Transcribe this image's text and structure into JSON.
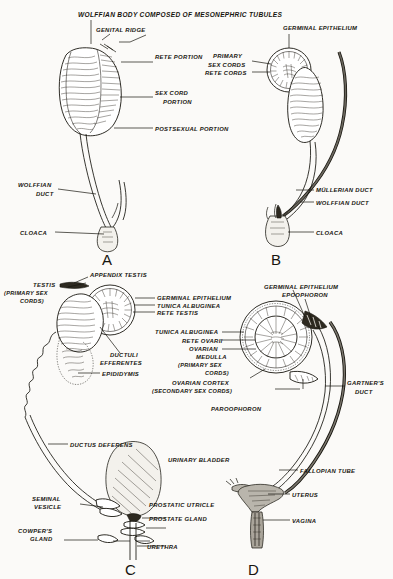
{
  "figure": {
    "title": "WOLFFIAN BODY COMPOSED OF MESONEPHRIC TUBULES",
    "background_color": "#fbfaf8",
    "ink_color": "#17150f"
  },
  "panels": [
    {
      "letter": "A",
      "name": "indifferent-gonad-stage",
      "labels": [
        {
          "id": "genital-ridge",
          "text": "GENITAL RIDGE"
        },
        {
          "id": "rete-portion",
          "text": "RETE PORTION"
        },
        {
          "id": "sex-cord-portion-1",
          "text": "SEX CORD"
        },
        {
          "id": "sex-cord-portion-2",
          "text": "PORTION"
        },
        {
          "id": "postsexual-portion",
          "text": "POSTSEXUAL PORTION"
        },
        {
          "id": "wolffian-duct-1",
          "text": "WOLFFIAN"
        },
        {
          "id": "wolffian-duct-2",
          "text": "DUCT"
        },
        {
          "id": "cloaca",
          "text": "CLOACA"
        }
      ]
    },
    {
      "letter": "B",
      "name": "gonad-with-mullerian-duct",
      "labels": [
        {
          "id": "germinal-epithelium",
          "text": "GERMINAL EPITHELIUM"
        },
        {
          "id": "primary-sex-cords-1",
          "text": "PRIMARY"
        },
        {
          "id": "primary-sex-cords-2",
          "text": "SEX CORDS"
        },
        {
          "id": "rete-cords",
          "text": "RETE CORDS"
        },
        {
          "id": "mullerian-duct",
          "text": "MÜLLERIAN DUCT"
        },
        {
          "id": "wolffian-duct",
          "text": "WOLFFIAN DUCT"
        },
        {
          "id": "cloaca",
          "text": "CLOACA"
        }
      ]
    },
    {
      "letter": "C",
      "name": "male-reproductive-tract",
      "labels": [
        {
          "id": "appendix-testis",
          "text": "APPENDIX TESTIS"
        },
        {
          "id": "testis-1",
          "text": "TESTIS"
        },
        {
          "id": "testis-2",
          "text": "(PRIMARY SEX"
        },
        {
          "id": "testis-3",
          "text": "CORDS)"
        },
        {
          "id": "germinal-epithelium",
          "text": "GERMINAL EPITHELIUM"
        },
        {
          "id": "tunica-albuginea",
          "text": "TUNICA ALBUGINEA"
        },
        {
          "id": "rete-testis",
          "text": "RETE TESTIS"
        },
        {
          "id": "ductuli-efferentes-1",
          "text": "DUCTULI"
        },
        {
          "id": "ductuli-efferentes-2",
          "text": "EFFERENTES"
        },
        {
          "id": "epididymis",
          "text": "EPIDIDYMIS"
        },
        {
          "id": "ductus-deferens",
          "text": "DUCTUS DEFERENS"
        },
        {
          "id": "urinary-bladder",
          "text": "URINARY BLADDER"
        },
        {
          "id": "seminal-vesicle-1",
          "text": "SEMINAL"
        },
        {
          "id": "seminal-vesicle-2",
          "text": "VESICLE"
        },
        {
          "id": "prostatic-utricle",
          "text": "PROSTATIC UTRICLE"
        },
        {
          "id": "prostate-gland",
          "text": "PROSTATE GLAND"
        },
        {
          "id": "cowpers-gland-1",
          "text": "COWPER'S"
        },
        {
          "id": "cowpers-gland-2",
          "text": "GLAND"
        },
        {
          "id": "urethra",
          "text": "URETHRA"
        }
      ]
    },
    {
      "letter": "D",
      "name": "female-reproductive-tract",
      "labels": [
        {
          "id": "germinal-epithelium",
          "text": "GERMINAL EPITHELIUM"
        },
        {
          "id": "epoophoron",
          "text": "EPOOPHORON"
        },
        {
          "id": "tunica-albuginea",
          "text": "TUNICA ALBUGINEA"
        },
        {
          "id": "rete-ovarii",
          "text": "RETE OVARII"
        },
        {
          "id": "ovarian-medulla-1",
          "text": "OVARIAN"
        },
        {
          "id": "ovarian-medulla-2",
          "text": "MEDULLA"
        },
        {
          "id": "ovarian-medulla-3",
          "text": "(PRIMARY SEX"
        },
        {
          "id": "ovarian-medulla-4",
          "text": "CORDS)"
        },
        {
          "id": "ovarian-cortex-1",
          "text": "OVARIAN CORTEX"
        },
        {
          "id": "ovarian-cortex-2",
          "text": "(SECONDARY SEX CORDS)"
        },
        {
          "id": "paroophoron",
          "text": "PAROOPHORON"
        },
        {
          "id": "gartners-duct-1",
          "text": "GARTNER'S"
        },
        {
          "id": "gartners-duct-2",
          "text": "DUCT"
        },
        {
          "id": "fallopian-tube",
          "text": "FALLOPIAN TUBE"
        },
        {
          "id": "uterus",
          "text": "UTERUS"
        },
        {
          "id": "vagina",
          "text": "VAGINA"
        }
      ]
    }
  ]
}
